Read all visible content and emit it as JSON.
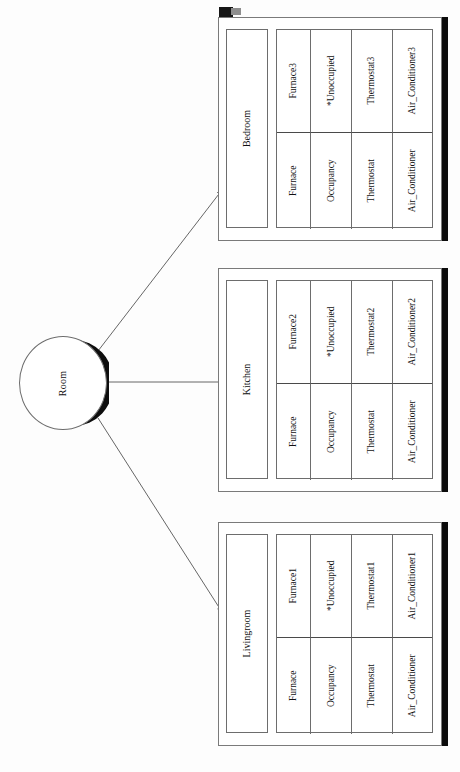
{
  "diagram": {
    "background_color": "#fdfdfd",
    "line_color": "#6d6d6d",
    "shadow_color": "#0b0b0b",
    "entity": {
      "name": "room-entity",
      "label": "Room"
    },
    "connector_labels": [
      "",
      "",
      ""
    ],
    "rooms": [
      {
        "id": "bedroom",
        "name": "Bedroom",
        "columns": [
          {
            "generic": "Furnace",
            "specific": "Furnace3"
          },
          {
            "generic": "Occupancy",
            "specific": "*Unoccupied"
          },
          {
            "generic": "Thermostat",
            "specific": "Thermostat3"
          },
          {
            "generic": "Air_Conditioner",
            "specific": "Air_Conditioner3"
          }
        ]
      },
      {
        "id": "kitchen",
        "name": "Kitchen",
        "columns": [
          {
            "generic": "Furnace",
            "specific": "Furnace2"
          },
          {
            "generic": "Occupancy",
            "specific": "*Unoccupied"
          },
          {
            "generic": "Thermostat",
            "specific": "Thermostat2"
          },
          {
            "generic": "Air_Conditioner",
            "specific": "Air_Conditioner2"
          }
        ]
      },
      {
        "id": "livingroom",
        "name": "Livingroom",
        "columns": [
          {
            "generic": "Furnace",
            "specific": "Furnace1"
          },
          {
            "generic": "Occupancy",
            "specific": "*Unoccupied"
          },
          {
            "generic": "Thermostat",
            "specific": "Thermostat1"
          },
          {
            "generic": "Air_Conditioner",
            "specific": "Air_Conditioner1"
          }
        ]
      }
    ]
  }
}
